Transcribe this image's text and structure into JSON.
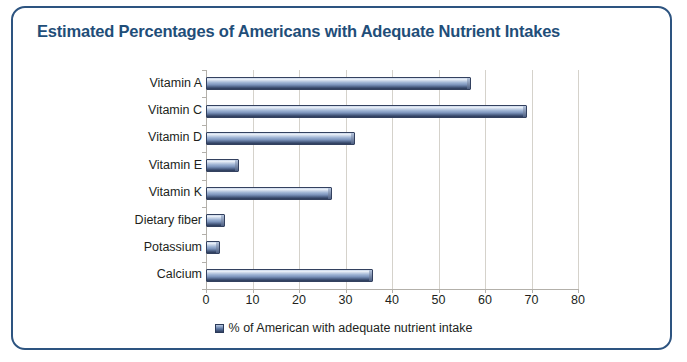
{
  "frame": {
    "border_color": "#2d5480"
  },
  "title": "Estimated Percentages of Americans with Adequate Nutrient Intakes",
  "legend": {
    "label": "% of American with adequate nutrient intake",
    "marker_color": "#4f6punk"
  },
  "chart_data": {
    "type": "bar",
    "orientation": "horizontal",
    "title": "Estimated Percentages of Americans with Adequate Nutrient Intakes",
    "xlabel": "",
    "ylabel": "",
    "categories": [
      "Vitamin A",
      "Vitamin C",
      "Vitamin D",
      "Vitamin E",
      "Vitamin K",
      "Dietary fiber",
      "Potassium",
      "Calcium"
    ],
    "values": [
      57,
      69,
      32,
      7,
      27,
      4,
      3,
      36
    ],
    "series": [
      {
        "name": "% of American with adequate nutrient intake",
        "values": [
          57,
          69,
          32,
          7,
          27,
          4,
          3,
          36
        ]
      }
    ],
    "xlim": [
      0,
      80
    ],
    "xticks": [
      0,
      10,
      20,
      30,
      40,
      50,
      60,
      70,
      80
    ],
    "xtick_labels": [
      "0",
      "10",
      "20",
      "30",
      "40",
      "50",
      "60",
      "70",
      "80"
    ],
    "grid": "vertical",
    "legend_position": "bottom",
    "bar_color": "#4f6punk"
  }
}
